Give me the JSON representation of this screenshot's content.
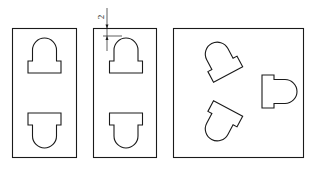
{
  "figure": {
    "panels": [
      {
        "id": "panel-1",
        "description": "rectangular plate with two opposed keyhole slots"
      },
      {
        "id": "panel-2",
        "description": "rectangular plate with two opposed keyhole slots, dimensioned"
      },
      {
        "id": "panel-3",
        "description": "square plate with three keyhole slots arranged radially"
      }
    ],
    "dimension": {
      "label": "2",
      "orientation": "vertical"
    },
    "colors": {
      "line": "#1a1a1a",
      "background": "#ffffff"
    }
  }
}
